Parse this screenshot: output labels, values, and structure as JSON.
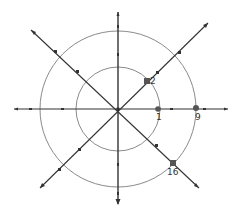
{
  "diagram": {
    "type": "polar-coordinate-spiral-diagram",
    "center": [
      118,
      109
    ],
    "circles": [
      {
        "name": "inner-circle",
        "radius": 41,
        "color": "#8a8a8a"
      },
      {
        "name": "outer-circle",
        "radius": 78,
        "color": "#8a8a8a"
      }
    ],
    "axis_color": "#333333",
    "points": [
      {
        "label": "1",
        "x": 158,
        "y": 109,
        "label_x": 155,
        "label_y": 113
      },
      {
        "label": "2",
        "x": 147,
        "y": 81,
        "label_x": 150,
        "label_y": 78
      },
      {
        "label": "9",
        "x": 196,
        "y": 108,
        "label_x": 194,
        "label_y": 113
      },
      {
        "label": "16",
        "x": 173,
        "y": 163,
        "label_x": 167,
        "label_y": 168
      }
    ]
  }
}
